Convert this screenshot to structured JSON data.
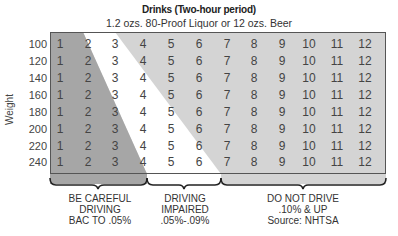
{
  "chart_data": {
    "type": "table",
    "title": "Drinks (Two-hour period)",
    "subtitle": "1.2 ozs. 80-Proof Liquor or 12 ozs. Beer",
    "ylabel": "Weight",
    "columns": [
      "1",
      "2",
      "3",
      "4",
      "5",
      "6",
      "7",
      "8",
      "9",
      "10",
      "11",
      "12"
    ],
    "rows": [
      {
        "weight": "100",
        "values": [
          "1",
          "2",
          "3",
          "4",
          "5",
          "6",
          "7",
          "8",
          "9",
          "10",
          "11",
          "12"
        ]
      },
      {
        "weight": "120",
        "values": [
          "1",
          "2",
          "3",
          "4",
          "5",
          "6",
          "7",
          "8",
          "9",
          "10",
          "11",
          "12"
        ]
      },
      {
        "weight": "140",
        "values": [
          "1",
          "2",
          "3",
          "4",
          "5",
          "6",
          "7",
          "8",
          "9",
          "10",
          "11",
          "12"
        ]
      },
      {
        "weight": "160",
        "values": [
          "1",
          "2",
          "3",
          "4",
          "5",
          "6",
          "7",
          "8",
          "9",
          "10",
          "11",
          "12"
        ]
      },
      {
        "weight": "180",
        "values": [
          "1",
          "2",
          "3",
          "4",
          "5",
          "6",
          "7",
          "8",
          "9",
          "10",
          "11",
          "12"
        ]
      },
      {
        "weight": "200",
        "values": [
          "1",
          "2",
          "3",
          "4",
          "5",
          "6",
          "7",
          "8",
          "9",
          "10",
          "11",
          "12"
        ]
      },
      {
        "weight": "220",
        "values": [
          "1",
          "2",
          "3",
          "4",
          "5",
          "6",
          "7",
          "8",
          "9",
          "10",
          "11",
          "12"
        ]
      },
      {
        "weight": "240",
        "values": [
          "1",
          "2",
          "3",
          "4",
          "5",
          "6",
          "7",
          "8",
          "9",
          "10",
          "11",
          "12"
        ]
      }
    ],
    "zones": [
      {
        "name": "BE CAREFUL DRIVING",
        "detail": "BAC TO .05%",
        "color": "#a6a6a6"
      },
      {
        "name": "DRIVING IMPAIRED",
        "detail": ".05%-.09%",
        "color": "#ffffff"
      },
      {
        "name": "DO NOT DRIVE",
        "detail": ".10% & UP",
        "color": "#d4d4d4"
      }
    ],
    "source": "Source: NHTSA"
  },
  "colors": {
    "dark_zone": "#a6a6a6",
    "mid_zone": "#ffffff",
    "light_zone": "#d4d4d4",
    "border": "#555555"
  }
}
